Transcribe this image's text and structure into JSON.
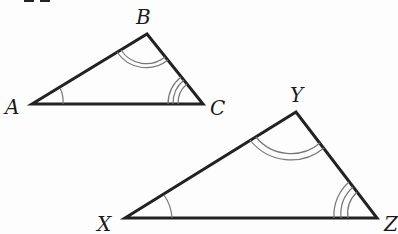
{
  "diagram": {
    "type": "similar-triangles",
    "triangles": [
      {
        "name": "ABC",
        "vertices": {
          "A": {
            "label": "A",
            "x": 32,
            "y": 104
          },
          "B": {
            "label": "B",
            "x": 147,
            "y": 34
          },
          "C": {
            "label": "C",
            "x": 203,
            "y": 104
          }
        },
        "angle_marks": {
          "A": 1,
          "B": 2,
          "C": 3
        }
      },
      {
        "name": "XYZ",
        "vertices": {
          "X": {
            "label": "X",
            "x": 125,
            "y": 218
          },
          "Y": {
            "label": "Y",
            "x": 296,
            "y": 112
          },
          "Z": {
            "label": "Z",
            "x": 377,
            "y": 218
          }
        },
        "angle_marks": {
          "X": 1,
          "Y": 2,
          "Z": 3
        }
      }
    ],
    "labels": {
      "A": "A",
      "B": "B",
      "C": "C",
      "X": "X",
      "Y": "Y",
      "Z": "Z"
    },
    "colors": {
      "edge": "#222222",
      "arc": "#777777",
      "background": "#fdfdfd"
    }
  }
}
